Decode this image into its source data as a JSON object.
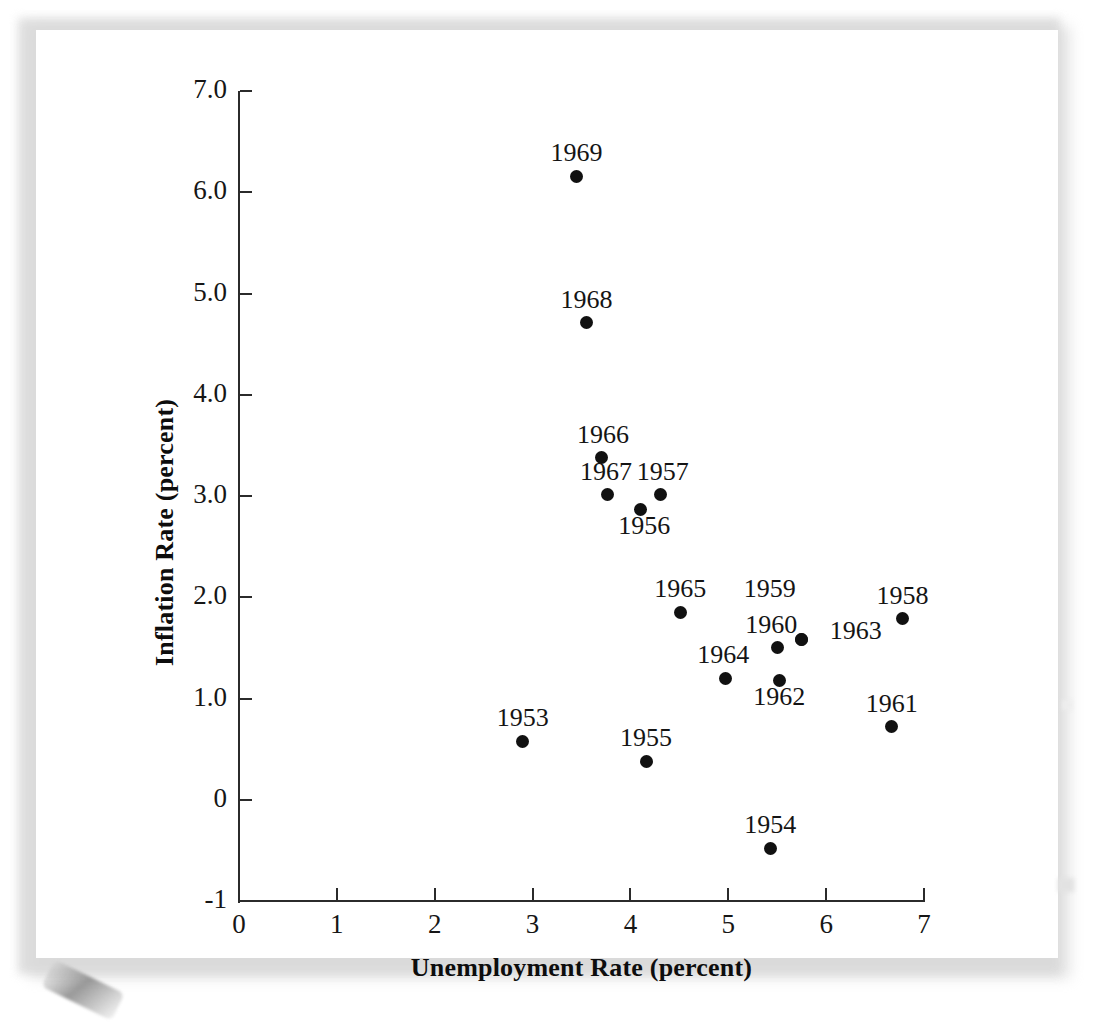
{
  "chart_data": {
    "type": "scatter",
    "title": "",
    "xlabel": "Unemployment Rate (percent)",
    "ylabel": "Inflation Rate (percent)",
    "xlim": [
      0,
      7
    ],
    "ylim": [
      -1,
      7
    ],
    "xticks": [
      "0",
      "1",
      "2",
      "3",
      "4",
      "5",
      "6",
      "7"
    ],
    "xtick_values": [
      0,
      1,
      2,
      3,
      4,
      5,
      6,
      7
    ],
    "yticks": [
      "-1",
      "0",
      "1.0",
      "2.0",
      "3.0",
      "4.0",
      "5.0",
      "6.0",
      "7.0"
    ],
    "ytick_values": [
      -1,
      0,
      1,
      2,
      3,
      4,
      5,
      6,
      7
    ],
    "grid": false,
    "legend": "none",
    "marker_color": "#111111",
    "axis_color": "#2b2b2b",
    "points": [
      {
        "label": "1953",
        "x": 2.9,
        "y": 0.58,
        "label_dx": 0,
        "label_dy": -30
      },
      {
        "label": "1954",
        "x": 5.43,
        "y": -0.48,
        "label_dx": 0,
        "label_dy": -30
      },
      {
        "label": "1955",
        "x": 4.16,
        "y": 0.38,
        "label_dx": 0,
        "label_dy": -30
      },
      {
        "label": "1956",
        "x": 4.1,
        "y": 2.87,
        "label_dx": 4,
        "label_dy": 10
      },
      {
        "label": "1957",
        "x": 4.31,
        "y": 3.01,
        "label_dx": 2,
        "label_dy": -30
      },
      {
        "label": "1958",
        "x": 6.78,
        "y": 1.79,
        "label_dx": 0,
        "label_dy": -30
      },
      {
        "label": "1959",
        "x": 5.75,
        "y": 1.58,
        "label_dx": -32,
        "label_dy": -58
      },
      {
        "label": "1960",
        "x": 5.5,
        "y": 1.5,
        "label_dx": -6,
        "label_dy": -30
      },
      {
        "label": "1961",
        "x": 6.67,
        "y": 0.72,
        "label_dx": 0,
        "label_dy": -30
      },
      {
        "label": "1962",
        "x": 5.52,
        "y": 1.18,
        "label_dx": 0,
        "label_dy": 10
      },
      {
        "label": "1963",
        "x": 5.75,
        "y": 1.58,
        "label_dx": 54,
        "label_dy": -16
      },
      {
        "label": "1964",
        "x": 4.97,
        "y": 1.2,
        "label_dx": -2,
        "label_dy": -30
      },
      {
        "label": "1965",
        "x": 4.51,
        "y": 1.85,
        "label_dx": 0,
        "label_dy": -30
      },
      {
        "label": "1966",
        "x": 3.7,
        "y": 3.38,
        "label_dx": 2,
        "label_dy": -30
      },
      {
        "label": "1967",
        "x": 3.77,
        "y": 3.01,
        "label_dx": -2,
        "label_dy": -30
      },
      {
        "label": "1968",
        "x": 3.55,
        "y": 4.71,
        "label_dx": 0,
        "label_dy": -30
      },
      {
        "label": "1969",
        "x": 3.45,
        "y": 6.16,
        "label_dx": 0,
        "label_dy": -30
      }
    ]
  }
}
